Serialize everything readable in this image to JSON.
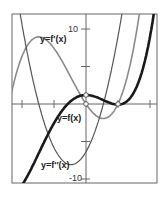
{
  "chart_data": {
    "type": "line",
    "title": "",
    "xlabel": "",
    "ylabel": "",
    "xlim": [
      -2.3,
      2.2
    ],
    "ylim": [
      -10.5,
      12
    ],
    "grid": false,
    "x_ticks": [
      -2,
      -1,
      1,
      2
    ],
    "y_ticks": [
      -10,
      -5,
      5,
      10
    ],
    "y_tick_labels": {
      "10": "10",
      "-10": "-10"
    },
    "series": [
      {
        "name": "y=f(x)",
        "style": "thick black",
        "color": "#1a1a1a",
        "description": "quartic-like; local max ~1.2 at x=0, local min ~0.3 near x=1, rises steeply after"
      },
      {
        "name": "y=f'(x)",
        "style": "gray",
        "color": "#8a8a8a",
        "description": "cubic; max ~8.7 near x=-1.3, roots at x=0 and x=1"
      },
      {
        "name": "y=f''(x)",
        "style": "dark thin",
        "color": "#555555",
        "description": "parabola; min ~-8.1 near x=-0.47, value ~-6.4 at x=0"
      }
    ],
    "markers": [
      {
        "x": 0,
        "y": 1.2,
        "on": "y=f(x)",
        "type": "open-circle"
      },
      {
        "x": 0,
        "y": 0,
        "on": "y=f'(x)",
        "type": "open-circle"
      },
      {
        "x": 1,
        "y": 0,
        "on": "y=f'(x)",
        "type": "open-circle"
      }
    ],
    "annotations": [
      "y=f'(x)",
      "y=f(x)",
      "y=f''(x)"
    ]
  },
  "labels": {
    "fprime": "y=f'(x)",
    "f": "y=f(x)",
    "fdouble": "y=f''(x)",
    "ytick_top": "10",
    "ytick_bottom": "-10"
  }
}
